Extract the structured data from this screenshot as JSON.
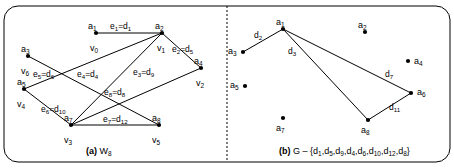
{
  "figure": {
    "panels": [
      {
        "id": "panel-a",
        "caption_prefix": "(a)",
        "caption_main": "W",
        "caption_sub": "8",
        "vertices": [
          {
            "name": "a1",
            "label_a": "a",
            "sub_a": "1",
            "label_v": "v",
            "sub_v": "0",
            "x": 96,
            "y": 33,
            "ax": 88,
            "ay": 22,
            "vx": 90,
            "vy": 44
          },
          {
            "name": "a2",
            "label_a": "a",
            "sub_a": "2",
            "label_v": "v",
            "sub_v": "1",
            "x": 162,
            "y": 33,
            "ax": 155,
            "ay": 22,
            "vx": 157,
            "vy": 44
          },
          {
            "name": "a3",
            "label_a": "a",
            "sub_a": "3",
            "label_v": "v",
            "sub_v": "6",
            "x": 28,
            "y": 56,
            "ax": 21,
            "ay": 45,
            "vx": 21,
            "vy": 67
          },
          {
            "name": "a4",
            "label_a": "a",
            "sub_a": "4",
            "label_v": "v",
            "sub_v": "2",
            "x": 201,
            "y": 68,
            "ax": 194,
            "ay": 57,
            "vx": 196,
            "vy": 79
          },
          {
            "name": "a5",
            "label_a": "a",
            "sub_a": "5",
            "label_v": "v",
            "sub_v": "4",
            "x": 24,
            "y": 89,
            "ax": 17,
            "ay": 78,
            "vx": 17,
            "vy": 100
          },
          {
            "name": "a7",
            "label_a": "a",
            "sub_a": "7",
            "label_v": "v",
            "sub_v": "3",
            "x": 71,
            "y": 125,
            "ax": 64,
            "ay": 114,
            "vx": 64,
            "vy": 136
          },
          {
            "name": "a8",
            "label_a": "a",
            "sub_a": "8",
            "label_v": "v",
            "sub_v": "5",
            "x": 159,
            "y": 125,
            "ax": 152,
            "ay": 114,
            "vx": 152,
            "vy": 136
          }
        ],
        "edges": [
          {
            "name": "e1",
            "from": "a1",
            "to": "a2",
            "label_e": "e",
            "sub_e": "1",
            "label_d": "d",
            "sub_d": "1",
            "lx": 110,
            "ly": 22
          },
          {
            "name": "e2",
            "from": "a2",
            "to": "a4",
            "label_e": "e",
            "sub_e": "2",
            "label_d": "d",
            "sub_d": "5",
            "lx": 172,
            "ly": 45
          },
          {
            "name": "e3",
            "from": "a4",
            "to": "a7",
            "label_e": "e",
            "sub_e": "3",
            "label_d": "d",
            "sub_d": "9",
            "lx": 133,
            "ly": 68
          },
          {
            "name": "e4",
            "from": "a2",
            "to": "a7",
            "label_e": "e",
            "sub_e": "4",
            "label_d": "d",
            "sub_d": "4",
            "lx": 77,
            "ly": 70
          },
          {
            "name": "e5",
            "from": "a3",
            "to": "a8",
            "label_e": "e",
            "sub_e": "5",
            "label_d": "d",
            "sub_d": "6",
            "lx": 33,
            "ly": 70
          },
          {
            "name": "e6",
            "from": "a5",
            "to": "a7",
            "label_e": "e",
            "sub_e": "6",
            "label_d": "d",
            "sub_d": "10",
            "lx": 41,
            "ly": 105
          },
          {
            "name": "e7",
            "from": "a7",
            "to": "a8",
            "label_e": "e",
            "sub_e": "7",
            "label_d": "d",
            "sub_d": "12",
            "lx": 103,
            "ly": 115
          },
          {
            "name": "e8",
            "from": "a5",
            "to": "a2",
            "label_e": "e",
            "sub_e": "8",
            "label_d": "d",
            "sub_d": "8",
            "lx": 104,
            "ly": 88
          }
        ]
      },
      {
        "id": "panel-b",
        "caption_prefix": "(b)",
        "caption_main": "G – {",
        "caption_close": "}",
        "removed_edges": [
          {
            "label": "d",
            "sub": "1"
          },
          {
            "label": "d",
            "sub": "5"
          },
          {
            "label": "d",
            "sub": "9"
          },
          {
            "label": "d",
            "sub": "4"
          },
          {
            "label": "d",
            "sub": "6"
          },
          {
            "label": "d",
            "sub": "10"
          },
          {
            "label": "d",
            "sub": "12"
          },
          {
            "label": "d",
            "sub": "8"
          }
        ],
        "vertices": [
          {
            "name": "a1",
            "label_a": "a",
            "sub_a": "1",
            "x": 283,
            "y": 29,
            "ax": 276,
            "ay": 18
          },
          {
            "name": "a2",
            "label_a": "a",
            "sub_a": "2",
            "x": 365,
            "y": 32,
            "ax": 358,
            "ay": 21
          },
          {
            "name": "a3",
            "label_a": "a",
            "sub_a": "3",
            "x": 243,
            "y": 52,
            "ax": 228,
            "ay": 47
          },
          {
            "name": "a4",
            "label_a": "a",
            "sub_a": "4",
            "x": 408,
            "y": 61,
            "ax": 414,
            "ay": 57
          },
          {
            "name": "a5",
            "label_a": "a",
            "sub_a": "5",
            "x": 245,
            "y": 86,
            "ax": 230,
            "ay": 81
          },
          {
            "name": "a6",
            "label_a": "a",
            "sub_a": "6",
            "x": 411,
            "y": 93,
            "ax": 417,
            "ay": 88
          },
          {
            "name": "a7",
            "label_a": "a",
            "sub_a": "7",
            "x": 283,
            "y": 118,
            "ax": 276,
            "ay": 124
          },
          {
            "name": "a8",
            "label_a": "a",
            "sub_a": "8",
            "x": 368,
            "y": 120,
            "ax": 361,
            "ay": 126
          }
        ],
        "edges": [
          {
            "name": "d2",
            "from": "a1",
            "to": "a3",
            "label_d": "d",
            "sub_d": "2",
            "lx": 254,
            "ly": 31
          },
          {
            "name": "d3",
            "from": "a1",
            "to": "a8",
            "label_d": "d",
            "sub_d": "3",
            "lx": 288,
            "ly": 47
          },
          {
            "name": "d7",
            "from": "a1",
            "to": "a6",
            "label_d": "d",
            "sub_d": "7",
            "lx": 385,
            "ly": 70
          },
          {
            "name": "d11",
            "from": "a6",
            "to": "a8",
            "label_d": "d",
            "sub_d": "11",
            "lx": 389,
            "ly": 103
          }
        ]
      }
    ]
  }
}
